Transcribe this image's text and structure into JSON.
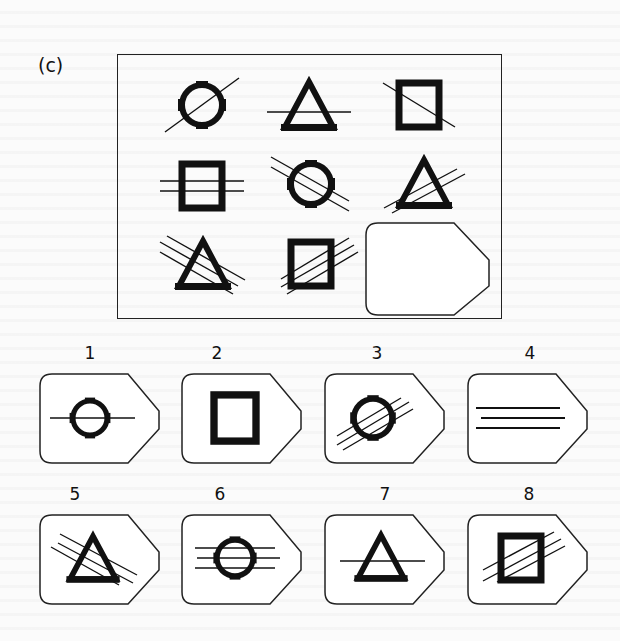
{
  "puzzle": {
    "label": "(c)",
    "type": "progressive-matrix",
    "matrix": [
      [
        {
          "shape": "circle",
          "lines": 1,
          "orientation": "ascending-diagonal"
        },
        {
          "shape": "triangle",
          "lines": 1,
          "orientation": "horizontal"
        },
        {
          "shape": "square",
          "lines": 1,
          "orientation": "descending-diagonal"
        }
      ],
      [
        {
          "shape": "square",
          "lines": 2,
          "orientation": "horizontal"
        },
        {
          "shape": "circle",
          "lines": 2,
          "orientation": "descending-diagonal"
        },
        {
          "shape": "triangle",
          "lines": 2,
          "orientation": "ascending-diagonal"
        }
      ],
      [
        {
          "shape": "triangle",
          "lines": 3,
          "orientation": "descending-diagonal"
        },
        {
          "shape": "square",
          "lines": 3,
          "orientation": "ascending-diagonal"
        },
        {
          "shape": "missing"
        }
      ]
    ],
    "options": [
      {
        "number": "1",
        "shape": "circle",
        "lines": 1,
        "orientation": "horizontal"
      },
      {
        "number": "2",
        "shape": "square",
        "lines": 0,
        "orientation": "none"
      },
      {
        "number": "3",
        "shape": "circle",
        "lines": 3,
        "orientation": "ascending-diagonal"
      },
      {
        "number": "4",
        "shape": "none",
        "lines": 3,
        "orientation": "horizontal"
      },
      {
        "number": "5",
        "shape": "triangle",
        "lines": 3,
        "orientation": "descending-diagonal"
      },
      {
        "number": "6",
        "shape": "circle",
        "lines": 3,
        "orientation": "horizontal"
      },
      {
        "number": "7",
        "shape": "triangle",
        "lines": 1,
        "orientation": "horizontal"
      },
      {
        "number": "8",
        "shape": "square",
        "lines": 3,
        "orientation": "ascending-diagonal"
      }
    ]
  }
}
